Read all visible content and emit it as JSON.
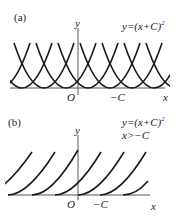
{
  "panels": [
    {
      "id": "a",
      "label": "(a)",
      "equation": "y=(x+C)",
      "equation_exp": "2",
      "condition": "",
      "axis_x": "x",
      "axis_y": "y",
      "origin": "O",
      "tick": "−C"
    },
    {
      "id": "b",
      "label": "(b)",
      "equation": "y=(x+C)",
      "equation_exp": "2",
      "condition": "x>−C",
      "axis_x": "x",
      "axis_y": "y",
      "origin": "O",
      "tick": "−C"
    }
  ],
  "colors": {
    "stroke": "#1a1a1a",
    "axis": "#555555"
  }
}
